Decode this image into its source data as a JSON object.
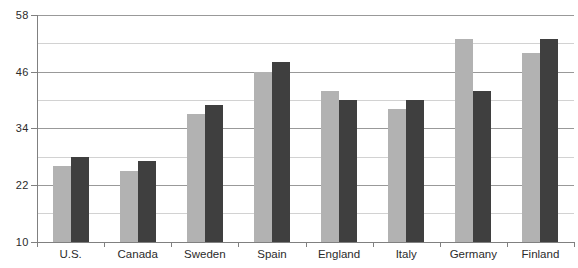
{
  "chart_data": {
    "type": "bar",
    "title": "",
    "xlabel": "",
    "ylabel": "",
    "categories": [
      "U.S.",
      "Canada",
      "Sweden",
      "Spain",
      "England",
      "Italy",
      "Germany",
      "Finland"
    ],
    "series": [
      {
        "name": "light-gray-bars",
        "color": "#b2b2b2",
        "values": [
          26,
          25,
          37,
          46,
          42,
          38,
          53,
          50
        ]
      },
      {
        "name": "dark-gray-bars",
        "color": "#3f3f3f",
        "values": [
          28,
          27,
          39,
          48,
          40,
          40,
          42,
          53
        ]
      }
    ],
    "ylim": [
      10,
      58
    ],
    "yticks": [
      58,
      46,
      34,
      22,
      10
    ],
    "gridline_step": 6,
    "grid": "on",
    "legend": "none",
    "colors": {
      "major_gridline": "#999999",
      "minor_gridline": "#d2d2d2",
      "axis": "#808080",
      "label_text": "#2b2b2b",
      "background": "#ffffff"
    }
  }
}
